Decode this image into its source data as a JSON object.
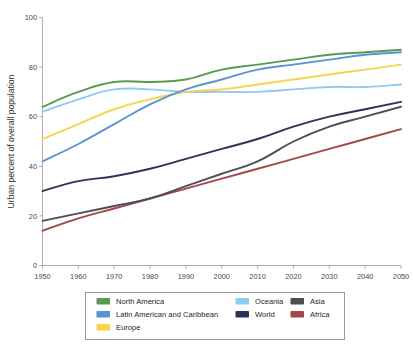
{
  "chart_data": {
    "type": "line",
    "title": "",
    "xlabel": "",
    "ylabel": "Urban percent of overall population",
    "xlim": [
      1950,
      2050
    ],
    "ylim": [
      0,
      100
    ],
    "grid": false,
    "legend_position": "bottom",
    "x": [
      1950,
      1960,
      1970,
      1980,
      1990,
      2000,
      2010,
      2020,
      2030,
      2040,
      2050
    ],
    "xtick_labels": [
      "1950",
      "1960",
      "1970",
      "1980",
      "1990",
      "2000",
      "2010",
      "2020",
      "2030",
      "2040",
      "2050"
    ],
    "ytick_labels": [
      "0",
      "20",
      "40",
      "60",
      "80",
      "100"
    ],
    "yticks": [
      0,
      20,
      40,
      60,
      80,
      100
    ],
    "series": [
      {
        "name": "North America",
        "color": "#5b9a4e",
        "values": [
          64,
          70,
          74,
          74,
          75,
          79,
          81,
          83,
          85,
          86,
          87
        ]
      },
      {
        "name": "Latin American and Caribbean",
        "color": "#5b92d4",
        "values": [
          42,
          49,
          57,
          65,
          71,
          75,
          79,
          81,
          83,
          85,
          86
        ]
      },
      {
        "name": "Europe",
        "color": "#f6d44c",
        "values": [
          51,
          57,
          63,
          67,
          70,
          71,
          73,
          75,
          77,
          79,
          81
        ]
      },
      {
        "name": "Oceania",
        "color": "#8ecbf0",
        "values": [
          62,
          67,
          71,
          71,
          70,
          70,
          70,
          71,
          72,
          72,
          73
        ]
      },
      {
        "name": "World",
        "color": "#2e3357",
        "values": [
          30,
          34,
          36,
          39,
          43,
          47,
          51,
          56,
          60,
          63,
          66
        ]
      },
      {
        "name": "Asia",
        "color": "#4a4f56",
        "values": [
          18,
          21,
          24,
          27,
          32,
          37,
          42,
          50,
          56,
          60,
          64
        ]
      },
      {
        "name": "Africa",
        "color": "#a5474a",
        "values": [
          14,
          19,
          23,
          27,
          31,
          35,
          39,
          43,
          47,
          51,
          55
        ]
      }
    ]
  },
  "axes": {
    "y_axis_title": "Urban percent of overall population"
  },
  "legend": {
    "columns": [
      [
        "North America",
        "Latin American and Caribbean",
        "Europe"
      ],
      [
        "Oceania",
        "World"
      ],
      [
        "Asia",
        "Africa"
      ]
    ],
    "entries": [
      {
        "label": "North America",
        "color": "#5b9a4e"
      },
      {
        "label": "Latin American and Caribbean",
        "color": "#5b92d4"
      },
      {
        "label": "Europe",
        "color": "#f6d44c"
      },
      {
        "label": "Oceania",
        "color": "#8ecbf0"
      },
      {
        "label": "World",
        "color": "#2e3357"
      },
      {
        "label": "Asia",
        "color": "#4a4f56"
      },
      {
        "label": "Africa",
        "color": "#a5474a"
      }
    ]
  }
}
